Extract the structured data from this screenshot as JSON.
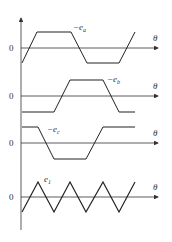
{
  "diagram": {
    "type": "waveform-stack",
    "x_axis_label": "θ",
    "zero_label": "0",
    "panels": [
      {
        "name": "phase-a",
        "label_prefix": "−e",
        "label_sub": "a",
        "shape": "trapezoid",
        "zero_y": 48,
        "points": "22,63 37,32 71,32 87,63 119,63 135,32"
      },
      {
        "name": "phase-b",
        "label_prefix": "−e",
        "label_sub": "b",
        "shape": "trapezoid",
        "zero_y": 96,
        "points": "22,112 54,112 70,80 103,80 119,112 135,112"
      },
      {
        "name": "phase-c",
        "label_prefix": "−e",
        "label_sub": "c",
        "shape": "trapezoid",
        "zero_y": 143,
        "points": "22,127 38,127 54,159 86,159 103,127 135,127"
      },
      {
        "name": "sum-e1",
        "label_prefix": "e",
        "label_sub": "1",
        "shape": "triangle",
        "zero_y": 197,
        "points": "22,212 38,182 54,212 70,182 86,212 103,182 119,212 135,182"
      }
    ]
  }
}
